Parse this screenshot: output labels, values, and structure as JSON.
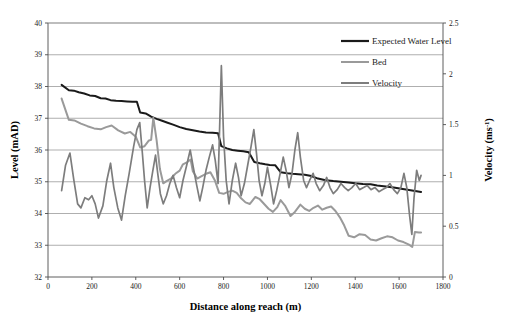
{
  "chart_data": {
    "type": "line",
    "title": "",
    "xlabel": "Distance along reach (m)",
    "ylabel": "Level (mAD)",
    "y2label": "Velocity (ms-1)",
    "y2label_base": "Velocity (ms",
    "y2label_sup": "-1",
    "y2label_close": ")",
    "xlim": [
      0,
      1800
    ],
    "ylim": [
      32,
      40
    ],
    "y2lim": [
      0,
      2.5
    ],
    "xticks": [
      0,
      200,
      400,
      600,
      800,
      1000,
      1200,
      1400,
      1600,
      1800
    ],
    "xtick_labels": [
      "0",
      "200",
      "400",
      "600",
      "800",
      "1000",
      "1200",
      "1400",
      "1600",
      "1800"
    ],
    "yticks": [
      32,
      33,
      34,
      35,
      36,
      37,
      38,
      39,
      40
    ],
    "ytick_labels": [
      "32",
      "33",
      "34",
      "35",
      "36",
      "37",
      "38",
      "39",
      "40"
    ],
    "y2ticks": [
      0,
      0.5,
      1,
      1.5,
      2,
      2.5
    ],
    "y2tick_labels": [
      "0",
      "0.5",
      "1",
      "1.5",
      "2",
      "2.5"
    ],
    "grid": "horizontal",
    "legend_position": "top-right",
    "series": [
      {
        "name": "Expected Water Level",
        "axis": "left",
        "color": "#1a1a1a",
        "width": 2.0,
        "points": [
          [
            62,
            38.05
          ],
          [
            95,
            37.88
          ],
          [
            118,
            37.87
          ],
          [
            140,
            37.82
          ],
          [
            165,
            37.78
          ],
          [
            190,
            37.72
          ],
          [
            215,
            37.7
          ],
          [
            240,
            37.63
          ],
          [
            262,
            37.62
          ],
          [
            285,
            37.57
          ],
          [
            310,
            37.55
          ],
          [
            335,
            37.54
          ],
          [
            360,
            37.53
          ],
          [
            385,
            37.52
          ],
          [
            405,
            37.52
          ],
          [
            420,
            37.18
          ],
          [
            445,
            37.15
          ],
          [
            470,
            37.05
          ],
          [
            495,
            36.98
          ],
          [
            520,
            36.92
          ],
          [
            545,
            36.86
          ],
          [
            570,
            36.8
          ],
          [
            600,
            36.72
          ],
          [
            630,
            36.66
          ],
          [
            660,
            36.62
          ],
          [
            690,
            36.58
          ],
          [
            720,
            36.55
          ],
          [
            750,
            36.54
          ],
          [
            775,
            36.53
          ],
          [
            790,
            36.12
          ],
          [
            815,
            36.05
          ],
          [
            840,
            36.0
          ],
          [
            865,
            35.98
          ],
          [
            890,
            35.96
          ],
          [
            915,
            35.93
          ],
          [
            940,
            35.62
          ],
          [
            965,
            35.58
          ],
          [
            990,
            35.55
          ],
          [
            1010,
            35.53
          ],
          [
            1035,
            35.52
          ],
          [
            1060,
            35.3
          ],
          [
            1090,
            35.27
          ],
          [
            1115,
            35.25
          ],
          [
            1140,
            35.24
          ],
          [
            1170,
            35.22
          ],
          [
            1200,
            35.18
          ],
          [
            1230,
            35.1
          ],
          [
            1265,
            35.05
          ],
          [
            1300,
            35.02
          ],
          [
            1335,
            35.0
          ],
          [
            1370,
            34.98
          ],
          [
            1400,
            34.95
          ],
          [
            1435,
            34.93
          ],
          [
            1470,
            34.92
          ],
          [
            1500,
            34.88
          ],
          [
            1540,
            34.85
          ],
          [
            1575,
            34.82
          ],
          [
            1610,
            34.78
          ],
          [
            1645,
            34.74
          ],
          [
            1680,
            34.7
          ],
          [
            1700,
            34.68
          ]
        ]
      },
      {
        "name": "Bed",
        "axis": "left",
        "color": "#9a9a9a",
        "width": 2.0,
        "points": [
          [
            62,
            37.62
          ],
          [
            95,
            36.95
          ],
          [
            120,
            36.93
          ],
          [
            150,
            36.83
          ],
          [
            180,
            36.75
          ],
          [
            210,
            36.68
          ],
          [
            240,
            36.65
          ],
          [
            265,
            36.72
          ],
          [
            290,
            36.77
          ],
          [
            320,
            36.62
          ],
          [
            350,
            36.52
          ],
          [
            375,
            36.57
          ],
          [
            400,
            36.42
          ],
          [
            420,
            36.08
          ],
          [
            440,
            36.12
          ],
          [
            460,
            36.3
          ],
          [
            470,
            36.32
          ],
          [
            480,
            37.02
          ],
          [
            495,
            36.3
          ],
          [
            510,
            35.4
          ],
          [
            525,
            34.95
          ],
          [
            540,
            35.02
          ],
          [
            560,
            35.1
          ],
          [
            580,
            35.25
          ],
          [
            600,
            35.35
          ],
          [
            615,
            35.55
          ],
          [
            635,
            35.62
          ],
          [
            650,
            35.7
          ],
          [
            660,
            35.33
          ],
          [
            680,
            35.1
          ],
          [
            700,
            35.18
          ],
          [
            720,
            35.25
          ],
          [
            740,
            35.3
          ],
          [
            760,
            35.05
          ],
          [
            780,
            34.65
          ],
          [
            800,
            34.62
          ],
          [
            820,
            34.68
          ],
          [
            840,
            34.72
          ],
          [
            860,
            34.65
          ],
          [
            880,
            34.48
          ],
          [
            900,
            34.35
          ],
          [
            920,
            34.3
          ],
          [
            945,
            34.52
          ],
          [
            965,
            34.45
          ],
          [
            985,
            34.3
          ],
          [
            1005,
            34.15
          ],
          [
            1025,
            34.05
          ],
          [
            1045,
            34.2
          ],
          [
            1060,
            34.42
          ],
          [
            1080,
            34.25
          ],
          [
            1105,
            33.92
          ],
          [
            1125,
            34.05
          ],
          [
            1150,
            34.28
          ],
          [
            1170,
            34.15
          ],
          [
            1190,
            34.08
          ],
          [
            1210,
            34.18
          ],
          [
            1230,
            34.25
          ],
          [
            1250,
            34.12
          ],
          [
            1270,
            34.18
          ],
          [
            1290,
            34.22
          ],
          [
            1310,
            34.08
          ],
          [
            1330,
            33.88
          ],
          [
            1350,
            33.62
          ],
          [
            1370,
            33.3
          ],
          [
            1395,
            33.25
          ],
          [
            1420,
            33.35
          ],
          [
            1445,
            33.32
          ],
          [
            1470,
            33.18
          ],
          [
            1495,
            33.15
          ],
          [
            1520,
            33.22
          ],
          [
            1545,
            33.28
          ],
          [
            1570,
            33.25
          ],
          [
            1595,
            33.15
          ],
          [
            1620,
            33.1
          ],
          [
            1645,
            33.02
          ],
          [
            1660,
            32.95
          ],
          [
            1672,
            33.42
          ],
          [
            1690,
            33.4
          ],
          [
            1700,
            33.4
          ]
        ]
      },
      {
        "name": "Velocity",
        "axis": "right",
        "color": "#7d7d7d",
        "width": 1.7,
        "points": [
          [
            62,
            0.85
          ],
          [
            80,
            1.1
          ],
          [
            100,
            1.22
          ],
          [
            118,
            0.95
          ],
          [
            135,
            0.72
          ],
          [
            150,
            0.68
          ],
          [
            168,
            0.78
          ],
          [
            185,
            0.76
          ],
          [
            200,
            0.8
          ],
          [
            215,
            0.72
          ],
          [
            230,
            0.58
          ],
          [
            250,
            0.7
          ],
          [
            268,
            0.95
          ],
          [
            285,
            1.12
          ],
          [
            300,
            0.88
          ],
          [
            318,
            0.68
          ],
          [
            335,
            0.56
          ],
          [
            352,
            0.8
          ],
          [
            370,
            1.02
          ],
          [
            390,
            1.28
          ],
          [
            405,
            1.45
          ],
          [
            418,
            1.52
          ],
          [
            430,
            1.22
          ],
          [
            440,
            0.95
          ],
          [
            452,
            0.68
          ],
          [
            465,
            0.88
          ],
          [
            478,
            1.05
          ],
          [
            490,
            1.2
          ],
          [
            500,
            1.02
          ],
          [
            512,
            0.82
          ],
          [
            525,
            0.72
          ],
          [
            540,
            0.8
          ],
          [
            555,
            0.92
          ],
          [
            570,
            1.0
          ],
          [
            585,
            0.88
          ],
          [
            600,
            0.78
          ],
          [
            615,
            0.95
          ],
          [
            632,
            1.1
          ],
          [
            648,
            1.25
          ],
          [
            662,
            1.08
          ],
          [
            678,
            0.9
          ],
          [
            692,
            0.75
          ],
          [
            705,
            0.88
          ],
          [
            720,
            1.05
          ],
          [
            735,
            1.18
          ],
          [
            750,
            1.3
          ],
          [
            762,
            1.15
          ],
          [
            775,
            0.92
          ],
          [
            790,
            2.08
          ],
          [
            800,
            1.38
          ],
          [
            812,
            0.95
          ],
          [
            825,
            0.72
          ],
          [
            840,
            0.95
          ],
          [
            855,
            1.12
          ],
          [
            868,
            0.98
          ],
          [
            880,
            0.8
          ],
          [
            895,
            0.92
          ],
          [
            910,
            1.1
          ],
          [
            925,
            1.28
          ],
          [
            938,
            1.45
          ],
          [
            950,
            1.22
          ],
          [
            962,
            0.95
          ],
          [
            975,
            0.8
          ],
          [
            988,
            0.92
          ],
          [
            1000,
            1.08
          ],
          [
            1015,
            0.9
          ],
          [
            1028,
            0.72
          ],
          [
            1042,
            0.85
          ],
          [
            1058,
            1.02
          ],
          [
            1072,
            1.18
          ],
          [
            1085,
            1.05
          ],
          [
            1098,
            0.88
          ],
          [
            1112,
            1.02
          ],
          [
            1125,
            1.25
          ],
          [
            1138,
            1.42
          ],
          [
            1150,
            1.18
          ],
          [
            1165,
            0.95
          ],
          [
            1178,
            0.88
          ],
          [
            1192,
            0.95
          ],
          [
            1208,
            1.02
          ],
          [
            1222,
            0.92
          ],
          [
            1238,
            0.85
          ],
          [
            1255,
            0.9
          ],
          [
            1270,
            0.98
          ],
          [
            1285,
            0.88
          ],
          [
            1300,
            0.82
          ],
          [
            1318,
            0.86
          ],
          [
            1335,
            0.92
          ],
          [
            1352,
            0.88
          ],
          [
            1368,
            0.85
          ],
          [
            1385,
            0.88
          ],
          [
            1402,
            0.92
          ],
          [
            1420,
            0.86
          ],
          [
            1438,
            0.88
          ],
          [
            1455,
            0.9
          ],
          [
            1472,
            0.86
          ],
          [
            1490,
            0.88
          ],
          [
            1508,
            0.84
          ],
          [
            1525,
            0.86
          ],
          [
            1542,
            0.88
          ],
          [
            1558,
            0.92
          ],
          [
            1575,
            0.86
          ],
          [
            1592,
            0.82
          ],
          [
            1608,
            0.88
          ],
          [
            1622,
            1.02
          ],
          [
            1635,
            0.88
          ],
          [
            1648,
            0.6
          ],
          [
            1658,
            0.42
          ],
          [
            1668,
            0.78
          ],
          [
            1680,
            1.05
          ],
          [
            1692,
            0.95
          ],
          [
            1700,
            1.0
          ]
        ]
      }
    ],
    "annotations": []
  },
  "legend": {
    "items": [
      {
        "label": "Expected Water Level",
        "color": "#1a1a1a"
      },
      {
        "label": "Bed",
        "color": "#9a9a9a"
      },
      {
        "label": "Velocity",
        "color": "#7d7d7d"
      }
    ]
  }
}
